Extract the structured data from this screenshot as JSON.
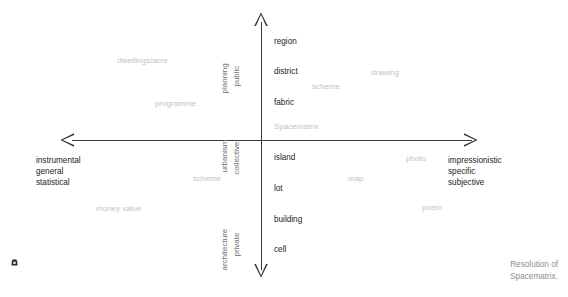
{
  "diagram": {
    "title": "Resolution of Spacematrix",
    "axes": {
      "vertical": {
        "upper_label_outer": "planning",
        "upper_label_inner": "public",
        "lower_label_outer": "architecture",
        "lower_label_inner": "private"
      },
      "horizontal": {
        "left_pole": [
          "instrumental",
          "general",
          "statistical"
        ],
        "right_pole": [
          "impressionistic",
          "specific",
          "subjective"
        ]
      },
      "center_label": "urbanism",
      "center_label_inner": "collective"
    },
    "scale_terms": [
      {
        "label": "region",
        "x": 274,
        "y": 37
      },
      {
        "label": "district",
        "x": 274,
        "y": 67
      },
      {
        "label": "fabric",
        "x": 274,
        "y": 98
      },
      {
        "label": "Spacematrix",
        "x": 274,
        "y": 122
      },
      {
        "label": "island",
        "x": 274,
        "y": 153
      },
      {
        "label": "lot",
        "x": 274,
        "y": 184
      },
      {
        "label": "building",
        "x": 274,
        "y": 215
      },
      {
        "label": "cell",
        "x": 274,
        "y": 245
      }
    ],
    "example_terms": [
      {
        "label": "dwellings/acre",
        "x": 117,
        "y": 56
      },
      {
        "label": "programme",
        "x": 155,
        "y": 99
      },
      {
        "label": "scheme",
        "x": 193,
        "y": 174
      },
      {
        "label": "money value",
        "x": 96,
        "y": 204
      },
      {
        "label": "scheme",
        "x": 312,
        "y": 82
      },
      {
        "label": "drawing",
        "x": 371,
        "y": 68
      },
      {
        "label": "photo",
        "x": 406,
        "y": 154
      },
      {
        "label": "map",
        "x": 348,
        "y": 174
      },
      {
        "label": "poem",
        "x": 422,
        "y": 203
      }
    ],
    "caption": [
      "Resolution of",
      "Spacematrix."
    ],
    "colors": {
      "axis": "#3a3a3a",
      "scale_text": "#1c1c1c",
      "example_text": "#c3c3c3",
      "caption_text": "#8e8e8e",
      "background": "#ffffff"
    }
  }
}
